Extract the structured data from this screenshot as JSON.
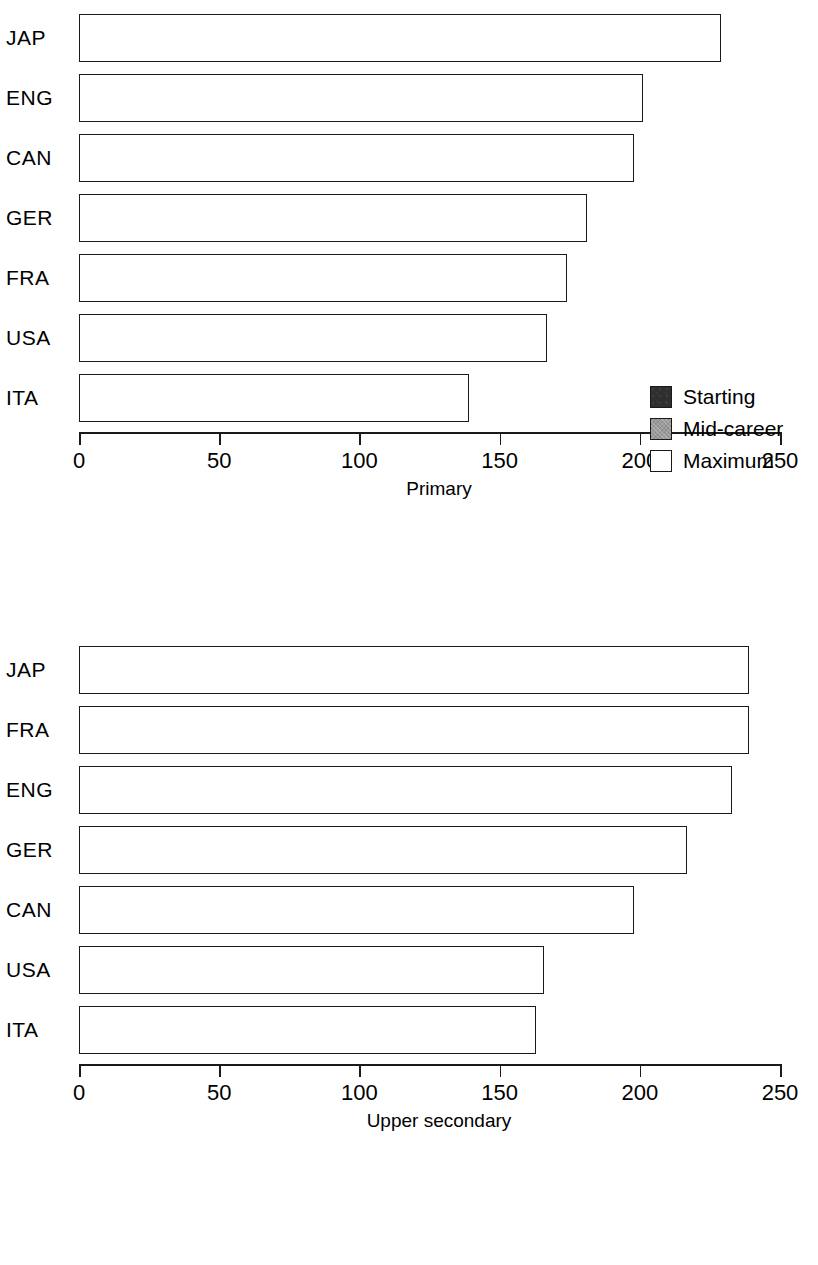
{
  "legend": {
    "items": [
      {
        "label": "Starting",
        "key": "starting",
        "color": "#2f2f2f"
      },
      {
        "label": "Mid-career",
        "key": "mid",
        "color": "#9a9a9a"
      },
      {
        "label": "Maximum",
        "key": "max",
        "color": "#ffffff"
      }
    ]
  },
  "axis": {
    "ticks": [
      "0",
      "50",
      "100",
      "150",
      "200",
      "250"
    ],
    "min": 0,
    "max": 250
  },
  "panels": [
    {
      "id": "primary",
      "axis_title": "Primary",
      "categories": [
        "JAP",
        "ENG",
        "CAN",
        "GER",
        "FRA",
        "USA",
        "ITA"
      ]
    },
    {
      "id": "upper-secondary",
      "axis_title": "Upper secondary",
      "categories": [
        "JAP",
        "FRA",
        "ENG",
        "GER",
        "CAN",
        "USA",
        "ITA"
      ]
    }
  ],
  "chart_data": [
    {
      "type": "bar",
      "orientation": "horizontal",
      "stacked": "cumulative",
      "title": "",
      "xlabel": "Primary",
      "ylabel": "",
      "xlim": [
        0,
        250
      ],
      "xticks": [
        0,
        50,
        100,
        150,
        200,
        250
      ],
      "grid": false,
      "legend": [
        "Starting",
        "Mid-career",
        "Maximum"
      ],
      "legend_position": "center-right",
      "categories": [
        "JAP",
        "ENG",
        "CAN",
        "GER",
        "FRA",
        "USA",
        "ITA"
      ],
      "series": [
        {
          "name": "Starting",
          "values": [
            91,
            99,
            108,
            135,
            90,
            96,
            88
          ]
        },
        {
          "name": "Mid-career",
          "values": [
            167,
            193,
            186,
            165,
            147,
            150,
            107
          ]
        },
        {
          "name": "Maximum",
          "values": [
            229,
            201,
            198,
            181,
            174,
            167,
            139
          ]
        }
      ]
    },
    {
      "type": "bar",
      "orientation": "horizontal",
      "stacked": "cumulative",
      "title": "",
      "xlabel": "Upper secondary",
      "ylabel": "",
      "xlim": [
        0,
        250
      ],
      "xticks": [
        0,
        50,
        100,
        150,
        200,
        250
      ],
      "grid": false,
      "legend": [
        "Starting",
        "Mid-career",
        "Maximum"
      ],
      "legend_position": "none",
      "categories": [
        "JAP",
        "FRA",
        "ENG",
        "GER",
        "CAN",
        "USA",
        "ITA"
      ],
      "series": [
        {
          "name": "Starting",
          "values": [
            94,
            163,
            104,
            157,
            107,
            96,
            96
          ]
        },
        {
          "name": "Mid-career",
          "values": [
            169,
            204,
            198,
            198,
            185,
            148,
            123
          ]
        },
        {
          "name": "Maximum",
          "values": [
            239,
            239,
            233,
            217,
            198,
            166,
            163
          ]
        }
      ]
    }
  ]
}
